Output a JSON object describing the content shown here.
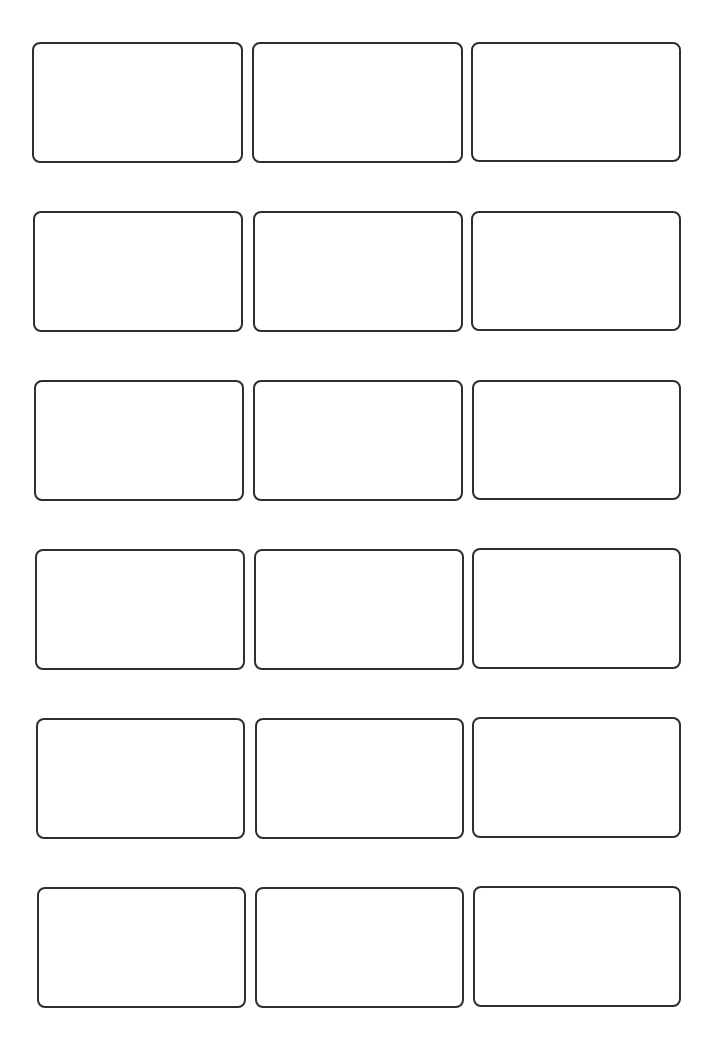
{
  "sheet": {
    "type": "label-sheet",
    "columns": 3,
    "rows": 6,
    "border_color": "#2e2e2e",
    "background": "#ffffff"
  },
  "labels": [
    {
      "row": 1,
      "col": 1,
      "text": "",
      "x": 32,
      "y": 42,
      "w": 211,
      "h": 121
    },
    {
      "row": 1,
      "col": 2,
      "text": "",
      "x": 252,
      "y": 42,
      "w": 211,
      "h": 121
    },
    {
      "row": 1,
      "col": 3,
      "text": "",
      "x": 471,
      "y": 42,
      "w": 210,
      "h": 120
    },
    {
      "row": 2,
      "col": 1,
      "text": "",
      "x": 33,
      "y": 211,
      "w": 210,
      "h": 121
    },
    {
      "row": 2,
      "col": 2,
      "text": "",
      "x": 253,
      "y": 211,
      "w": 210,
      "h": 121
    },
    {
      "row": 2,
      "col": 3,
      "text": "",
      "x": 471,
      "y": 211,
      "w": 210,
      "h": 120
    },
    {
      "row": 3,
      "col": 1,
      "text": "",
      "x": 34,
      "y": 380,
      "w": 210,
      "h": 121
    },
    {
      "row": 3,
      "col": 2,
      "text": "",
      "x": 253,
      "y": 380,
      "w": 210,
      "h": 121
    },
    {
      "row": 3,
      "col": 3,
      "text": "",
      "x": 472,
      "y": 380,
      "w": 209,
      "h": 120
    },
    {
      "row": 4,
      "col": 1,
      "text": "",
      "x": 35,
      "y": 549,
      "w": 210,
      "h": 121
    },
    {
      "row": 4,
      "col": 2,
      "text": "",
      "x": 254,
      "y": 549,
      "w": 210,
      "h": 121
    },
    {
      "row": 4,
      "col": 3,
      "text": "",
      "x": 472,
      "y": 548,
      "w": 209,
      "h": 121
    },
    {
      "row": 5,
      "col": 1,
      "text": "",
      "x": 36,
      "y": 718,
      "w": 209,
      "h": 121
    },
    {
      "row": 5,
      "col": 2,
      "text": "",
      "x": 255,
      "y": 718,
      "w": 209,
      "h": 121
    },
    {
      "row": 5,
      "col": 3,
      "text": "",
      "x": 472,
      "y": 717,
      "w": 209,
      "h": 121
    },
    {
      "row": 6,
      "col": 1,
      "text": "",
      "x": 37,
      "y": 887,
      "w": 209,
      "h": 121
    },
    {
      "row": 6,
      "col": 2,
      "text": "",
      "x": 255,
      "y": 887,
      "w": 209,
      "h": 121
    },
    {
      "row": 6,
      "col": 3,
      "text": "",
      "x": 473,
      "y": 886,
      "w": 208,
      "h": 121
    }
  ]
}
